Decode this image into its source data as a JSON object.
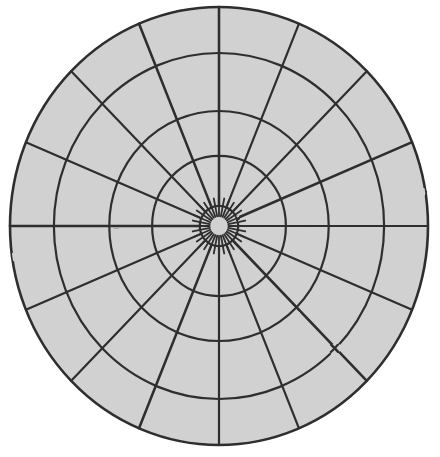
{
  "figure": {
    "kind": "radial-polar-grid",
    "canvas": {
      "width": 440,
      "height": 457
    },
    "background_color": "#ffffff"
  },
  "chart_data": {
    "type": "polar-grid",
    "title": "",
    "subtitle": "",
    "xlabel": "",
    "ylabel": "",
    "legend": [],
    "annotations": [],
    "grid": true,
    "legend_position": "none",
    "center": {
      "x": 219,
      "y": 226
    },
    "ellipse": {
      "rx": 209,
      "ry": 219
    },
    "fill_color": "#d2d2d2",
    "line_color": "#2e2e2e",
    "outline_width": 2.6,
    "ring_width": 2.2,
    "spoke_width": 2.2,
    "tick_width": 1.8,
    "ring_count": 5,
    "ring_radii_fraction": [
      1.0,
      0.79,
      0.525,
      0.32,
      0.092
    ],
    "ring_labels": [
      "outer-boundary",
      "ring-4",
      "ring-3",
      "ring-2",
      "hub-circle"
    ],
    "spoke_count": 16,
    "spoke_step_degrees": 22.5,
    "spoke_angles_degrees": [
      0,
      22.5,
      45,
      67.5,
      90,
      112.5,
      135,
      157.5,
      180,
      202.5,
      225,
      247.5,
      270,
      292.5,
      315,
      337.5
    ],
    "spoke_inner_fraction": 0.092,
    "spoke_outer_fraction": 1.0,
    "hub_tick_count": 32,
    "hub_tick_step_degrees": 11.25,
    "hub_tick_inner_fraction": 0.045,
    "hub_tick_outer_fraction": 0.128,
    "sectors_total": 64,
    "sector_note": "16 angular sectors x 4 radial bands between hub and outer boundary"
  }
}
